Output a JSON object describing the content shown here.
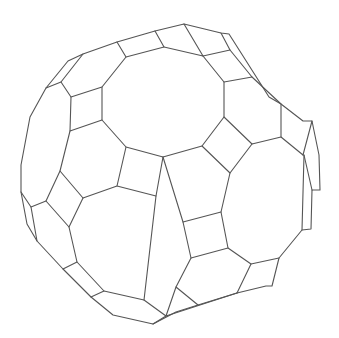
{
  "figure": {
    "title": "",
    "background": "#ffffff",
    "stroke_color": "#555555",
    "width": 339,
    "height": 338
  },
  "polylines": [
    [
      [
        83,
        54
      ],
      [
        117,
        42
      ],
      [
        155,
        31
      ],
      [
        184,
        24
      ],
      [
        221,
        33
      ],
      [
        229,
        34
      ],
      [
        243,
        56
      ],
      [
        269,
        97
      ],
      [
        281,
        104
      ],
      [
        303,
        121
      ],
      [
        312,
        121
      ],
      [
        319,
        155
      ],
      [
        320,
        190
      ],
      [
        312,
        190
      ],
      [
        311,
        229
      ],
      [
        302,
        230
      ],
      [
        279,
        258
      ],
      [
        272,
        286
      ],
      [
        266,
        286
      ],
      [
        237,
        293
      ],
      [
        198,
        305
      ],
      [
        176,
        312
      ],
      [
        153,
        324
      ],
      [
        113,
        315
      ],
      [
        91,
        297
      ],
      [
        63,
        269
      ],
      [
        37,
        241
      ],
      [
        27,
        224
      ],
      [
        21,
        192
      ],
      [
        21,
        165
      ],
      [
        30,
        117
      ],
      [
        46,
        88
      ],
      [
        68,
        61
      ],
      [
        83,
        54
      ]
    ],
    [
      [
        83,
        54
      ],
      [
        61,
        82
      ],
      [
        46,
        88
      ]
    ],
    [
      [
        61,
        82
      ],
      [
        71,
        97
      ],
      [
        102,
        87
      ],
      [
        126,
        57
      ],
      [
        117,
        42
      ]
    ],
    [
      [
        126,
        57
      ],
      [
        164,
        47
      ],
      [
        155,
        31
      ]
    ],
    [
      [
        164,
        47
      ],
      [
        203,
        56
      ],
      [
        184,
        24
      ]
    ],
    [
      [
        203,
        56
      ],
      [
        230,
        50
      ],
      [
        221,
        33
      ]
    ],
    [
      [
        230,
        50
      ],
      [
        252,
        77
      ],
      [
        224,
        82
      ],
      [
        203,
        56
      ]
    ],
    [
      [
        252,
        77
      ],
      [
        281,
        104
      ],
      [
        281,
        137
      ],
      [
        303,
        155
      ],
      [
        312,
        121
      ]
    ],
    [
      [
        303,
        155
      ],
      [
        304,
        155
      ],
      [
        312,
        190
      ]
    ],
    [
      [
        71,
        97
      ],
      [
        70,
        131
      ],
      [
        102,
        120
      ],
      [
        102,
        87
      ]
    ],
    [
      [
        102,
        120
      ],
      [
        126,
        147
      ],
      [
        163,
        157
      ],
      [
        202,
        146
      ],
      [
        224,
        117
      ],
      [
        224,
        82
      ]
    ],
    [
      [
        224,
        117
      ],
      [
        252,
        144
      ],
      [
        281,
        137
      ]
    ],
    [
      [
        252,
        144
      ],
      [
        230,
        173
      ],
      [
        202,
        146
      ]
    ],
    [
      [
        230,
        173
      ],
      [
        221,
        212
      ],
      [
        228,
        248
      ],
      [
        251,
        264
      ],
      [
        279,
        258
      ]
    ],
    [
      [
        251,
        264
      ],
      [
        237,
        293
      ]
    ],
    [
      [
        302,
        230
      ],
      [
        304,
        155
      ]
    ],
    [
      [
        70,
        131
      ],
      [
        60,
        171
      ],
      [
        46,
        201
      ],
      [
        31,
        207
      ],
      [
        21,
        192
      ]
    ],
    [
      [
        60,
        171
      ],
      [
        83,
        198
      ],
      [
        117,
        186
      ],
      [
        126,
        147
      ]
    ],
    [
      [
        46,
        201
      ],
      [
        69,
        227
      ],
      [
        83,
        198
      ]
    ],
    [
      [
        69,
        227
      ],
      [
        77,
        262
      ],
      [
        63,
        269
      ]
    ],
    [
      [
        31,
        207
      ],
      [
        37,
        241
      ]
    ],
    [
      [
        77,
        262
      ],
      [
        104,
        291
      ],
      [
        91,
        297
      ]
    ],
    [
      [
        104,
        291
      ],
      [
        144,
        300
      ],
      [
        166,
        316
      ],
      [
        153,
        324
      ]
    ],
    [
      [
        144,
        300
      ],
      [
        156,
        196
      ],
      [
        117,
        186
      ]
    ],
    [
      [
        166,
        316
      ],
      [
        176,
        287
      ],
      [
        198,
        305
      ]
    ],
    [
      [
        176,
        287
      ],
      [
        191,
        258
      ],
      [
        228,
        248
      ]
    ],
    [
      [
        191,
        258
      ],
      [
        183,
        222
      ],
      [
        221,
        212
      ]
    ],
    [
      [
        183,
        222
      ],
      [
        163,
        157
      ]
    ],
    [
      [
        156,
        196
      ],
      [
        163,
        157
      ]
    ],
    [
      [
        166,
        316
      ],
      [
        237,
        293
      ]
    ]
  ]
}
